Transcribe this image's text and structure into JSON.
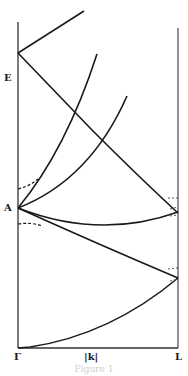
{
  "diagram": {
    "type": "band-structure",
    "labels": {
      "y_axis": "E",
      "point_A": "A",
      "x_left": "Γ",
      "x_mid": "|k|",
      "x_right": "L"
    },
    "caption": "Figure 1",
    "colors": {
      "line": "#1a1a1a",
      "axis": "#333333",
      "background": "#ffffff"
    }
  }
}
